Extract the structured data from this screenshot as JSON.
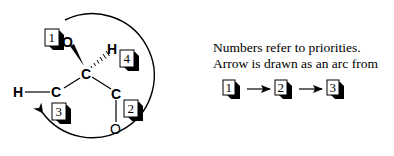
{
  "diagram": {
    "atoms": {
      "stereocenter": "C",
      "hydroxyl_oxygen": "O",
      "hydrogen_top": "H",
      "left_carbon": "C",
      "left_hydrogen": "H",
      "right_carbon": "C",
      "carbonyl_oxygen": "O"
    },
    "priorities": {
      "oxygen": "1",
      "carbonyl_carbon": "2",
      "methyl_carbon": "3",
      "hydrogen": "4"
    },
    "caption": {
      "line1": "Numbers refer to priorities.",
      "line2": "Arrow is drawn as an arc from"
    },
    "sequence": [
      "1",
      "2",
      "3"
    ]
  }
}
